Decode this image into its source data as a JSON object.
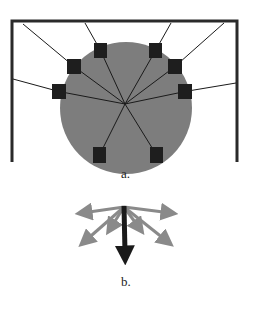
{
  "figure": {
    "panel_a": {
      "label": "a.",
      "colors": {
        "frame": "#2a2a2a",
        "circle": "#7d7d7d",
        "square": "#1e1e1e",
        "line": "#1a1a1a"
      },
      "frame": {
        "left": 12,
        "right": 237,
        "top": 21,
        "bottom": 162,
        "stroke": 3
      },
      "circle": {
        "cx": 126,
        "cy": 108,
        "r": 66
      },
      "center": {
        "x": 125,
        "y": 104
      },
      "squares": [
        {
          "x": 94,
          "y": 43,
          "w": 13,
          "h": 15,
          "anchor_x": 85,
          "anchor_y": 23
        },
        {
          "x": 149,
          "y": 43,
          "w": 13,
          "h": 15,
          "anchor_x": 171,
          "anchor_y": 23
        },
        {
          "x": 67,
          "y": 59,
          "w": 14,
          "h": 15,
          "anchor_x": 23,
          "anchor_y": 24
        },
        {
          "x": 168,
          "y": 59,
          "w": 14,
          "h": 15,
          "anchor_x": 224,
          "anchor_y": 23
        },
        {
          "x": 52,
          "y": 84,
          "w": 14,
          "h": 15,
          "anchor_x": 13,
          "anchor_y": 79
        },
        {
          "x": 178,
          "y": 84,
          "w": 14,
          "h": 15,
          "anchor_x": 236,
          "anchor_y": 83
        },
        {
          "x": 93,
          "y": 147,
          "w": 13,
          "h": 16,
          "anchor_x": null,
          "anchor_y": null
        },
        {
          "x": 150,
          "y": 147,
          "w": 13,
          "h": 16,
          "anchor_x": null,
          "anchor_y": null
        }
      ]
    },
    "panel_b": {
      "label": "b.",
      "colors": {
        "gray_arrow": "#8a8a8a",
        "black_arrow": "#1a1a1a"
      },
      "origin": {
        "x": 124,
        "y": 207
      },
      "gray_arrows": [
        {
          "x": 82,
          "y": 213
        },
        {
          "x": 171,
          "y": 213
        },
        {
          "x": 84,
          "y": 242
        },
        {
          "x": 168,
          "y": 242
        },
        {
          "x": 110,
          "y": 229
        },
        {
          "x": 140,
          "y": 229
        }
      ],
      "black_arrow": {
        "x": 125,
        "y": 263
      }
    }
  }
}
